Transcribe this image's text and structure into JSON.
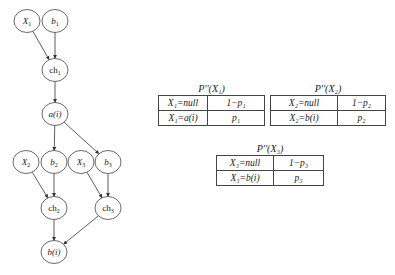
{
  "graph": {
    "nodes": [
      {
        "id": "X1",
        "label": "X",
        "sub": "1",
        "cx": 27,
        "cy": 21,
        "italic": true
      },
      {
        "id": "b1",
        "label": "b",
        "sub": "1",
        "cx": 55,
        "cy": 21,
        "italic": true
      },
      {
        "id": "ch1",
        "label": "ch",
        "sub": "1",
        "cx": 55,
        "cy": 70,
        "italic": false
      },
      {
        "id": "a_i",
        "label": "a(i)",
        "sub": "",
        "cx": 55,
        "cy": 114,
        "italic": true
      },
      {
        "id": "X2",
        "label": "X",
        "sub": "2",
        "cx": 26,
        "cy": 162,
        "italic": true
      },
      {
        "id": "b2",
        "label": "b",
        "sub": "2",
        "cx": 54,
        "cy": 162,
        "italic": true
      },
      {
        "id": "X3",
        "label": "X",
        "sub": "3",
        "cx": 81,
        "cy": 162,
        "italic": true
      },
      {
        "id": "b3",
        "label": "b",
        "sub": "3",
        "cx": 108,
        "cy": 162,
        "italic": true
      },
      {
        "id": "ch2",
        "label": "ch",
        "sub": "2",
        "cx": 54,
        "cy": 208,
        "italic": false
      },
      {
        "id": "ch3",
        "label": "ch",
        "sub": "3",
        "cx": 108,
        "cy": 208,
        "italic": false
      },
      {
        "id": "b_i",
        "label": "b(i)",
        "sub": "",
        "cx": 54,
        "cy": 252,
        "italic": true
      }
    ],
    "edges": [
      [
        "X1",
        "ch1"
      ],
      [
        "b1",
        "ch1"
      ],
      [
        "ch1",
        "a_i"
      ],
      [
        "a_i",
        "b2"
      ],
      [
        "a_i",
        "b3"
      ],
      [
        "X2",
        "ch2"
      ],
      [
        "b2",
        "ch2"
      ],
      [
        "X3",
        "ch3"
      ],
      [
        "b3",
        "ch3"
      ],
      [
        "ch2",
        "b_i"
      ],
      [
        "ch3",
        "b_i"
      ]
    ]
  },
  "tables": [
    {
      "title": "P''(X₁)",
      "rows": [
        [
          "X₁=null",
          "1−p₁"
        ],
        [
          "X₁=a(i)",
          "p₁"
        ]
      ]
    },
    {
      "title": "P''(X₂)",
      "rows": [
        [
          "X₂=null",
          "1−p₂"
        ],
        [
          "X₂=b(i)",
          "p₂"
        ]
      ]
    },
    {
      "title": "P''(X₃)",
      "rows": [
        [
          "X₃=null",
          "1−p₃"
        ],
        [
          "X₃=b(i)",
          "p₃"
        ]
      ]
    }
  ]
}
